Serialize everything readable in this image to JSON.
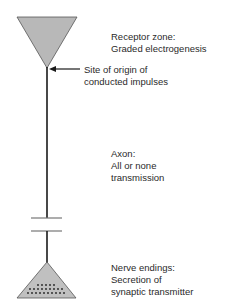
{
  "diagram": {
    "colors": {
      "triangle_fill": "#b8b8b8",
      "line": "#1a1a1a",
      "text": "#2a2a2a"
    },
    "labels": {
      "receptor": {
        "line1": "Receptor zone:",
        "line2": "Graded electrogenesis"
      },
      "origin": {
        "line1": "Site of origin of",
        "line2": "conducted impulses"
      },
      "axon": {
        "line1": "Axon:",
        "line2": "All or none",
        "line3": "transmission"
      },
      "endings": {
        "line1": "Nerve endings:",
        "line2": "Secretion of",
        "line3": "synaptic transmitter"
      }
    }
  }
}
